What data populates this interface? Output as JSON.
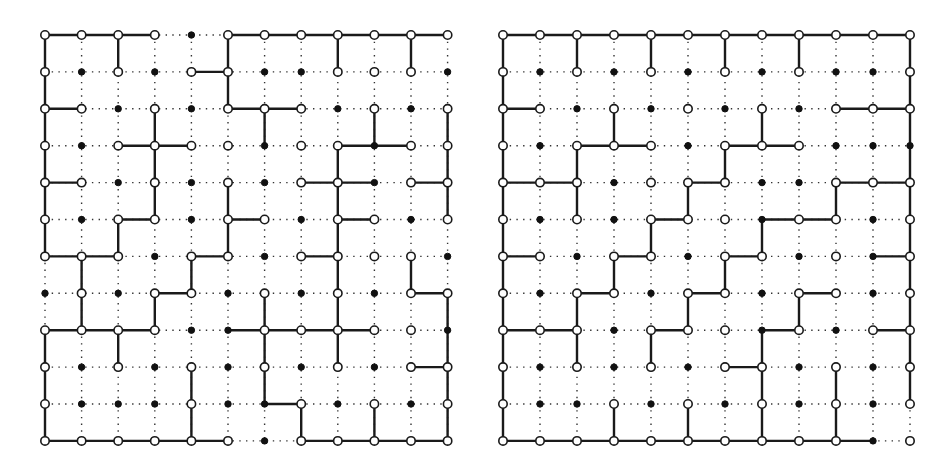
{
  "diagrams": [
    {
      "name": "left-grid",
      "origin": [
        45,
        35
      ],
      "spacing": [
        36.6,
        36.9
      ],
      "cols": 12,
      "rows": 12,
      "nodes": [
        "oooofooooooo",
        "ofofoofforof",
        "oofofooofofo",
        "ofoooofoofo o",
        "oofofofoofoo",
        "ofoofoofoofo",
        "ooofoofoooof",
        "fofoofofofoo",
        "ooooffooooofo",
        "ofofofofofoo",
        "offfoffofofo",
        "oooooofooooo"
      ],
      "h_edges": [
        [
          0,
          0
        ],
        [
          1,
          0
        ],
        [
          2,
          0
        ],
        [
          5,
          0
        ],
        [
          6,
          0
        ],
        [
          7,
          0
        ],
        [
          8,
          0
        ],
        [
          9,
          0
        ],
        [
          10,
          0
        ],
        [
          4,
          1
        ],
        [
          0,
          2
        ],
        [
          5,
          2
        ],
        [
          6,
          2
        ],
        [
          2,
          3
        ],
        [
          3,
          3
        ],
        [
          8,
          3
        ],
        [
          9,
          3
        ],
        [
          0,
          4
        ],
        [
          7,
          4
        ],
        [
          8,
          4
        ],
        [
          10,
          4
        ],
        [
          2,
          5
        ],
        [
          5,
          5
        ],
        [
          8,
          5
        ],
        [
          0,
          6
        ],
        [
          1,
          6
        ],
        [
          4,
          6
        ],
        [
          7,
          6
        ],
        [
          3,
          7
        ],
        [
          10,
          7
        ],
        [
          0,
          8
        ],
        [
          1,
          8
        ],
        [
          2,
          8
        ],
        [
          5,
          8
        ],
        [
          6,
          8
        ],
        [
          7,
          8
        ],
        [
          8,
          8
        ],
        [
          10,
          9
        ],
        [
          6,
          10
        ],
        [
          0,
          11
        ],
        [
          1,
          11
        ],
        [
          2,
          11
        ],
        [
          3,
          11
        ],
        [
          4,
          11
        ],
        [
          7,
          11
        ],
        [
          8,
          11
        ],
        [
          9,
          11
        ],
        [
          10,
          11
        ]
      ],
      "v_edges": [
        [
          0,
          0
        ],
        [
          2,
          0
        ],
        [
          5,
          0
        ],
        [
          8,
          0
        ],
        [
          10,
          0
        ],
        [
          0,
          1
        ],
        [
          5,
          1
        ],
        [
          0,
          2
        ],
        [
          3,
          2
        ],
        [
          6,
          2
        ],
        [
          9,
          2
        ],
        [
          11,
          2
        ],
        [
          0,
          3
        ],
        [
          3,
          3
        ],
        [
          8,
          3
        ],
        [
          11,
          3
        ],
        [
          0,
          4
        ],
        [
          3,
          4
        ],
        [
          5,
          4
        ],
        [
          8,
          4
        ],
        [
          11,
          4
        ],
        [
          0,
          5
        ],
        [
          2,
          5
        ],
        [
          5,
          5
        ],
        [
          8,
          5
        ],
        [
          1,
          6
        ],
        [
          4,
          6
        ],
        [
          8,
          6
        ],
        [
          10,
          6
        ],
        [
          1,
          7
        ],
        [
          3,
          7
        ],
        [
          6,
          7
        ],
        [
          8,
          7
        ],
        [
          11,
          7
        ],
        [
          0,
          8
        ],
        [
          2,
          8
        ],
        [
          6,
          8
        ],
        [
          8,
          8
        ],
        [
          11,
          8
        ],
        [
          0,
          9
        ],
        [
          4,
          9
        ],
        [
          6,
          9
        ],
        [
          11,
          9
        ],
        [
          0,
          10
        ],
        [
          4,
          10
        ],
        [
          7,
          10
        ],
        [
          9,
          10
        ],
        [
          11,
          10
        ]
      ]
    },
    {
      "name": "right-grid",
      "origin": [
        503,
        35
      ],
      "spacing": [
        37.0,
        36.9
      ],
      "cols": 12,
      "rows": 12,
      "nodes": [
        "oooooooooooo",
        "ofofofofoffo",
        "oofofofofooo",
        "ofooofooofffo",
        "ooofoooffooo",
        "ofofooofoofo",
        "oofoofoofofo",
        "ofoofoofoofo",
        "ooofooofofoo",
        "ofofofoofofo",
        "offofofofofo",
        "oooooooooof"
      ],
      "h_edges": [
        [
          0,
          0
        ],
        [
          1,
          0
        ],
        [
          2,
          0
        ],
        [
          3,
          0
        ],
        [
          4,
          0
        ],
        [
          5,
          0
        ],
        [
          6,
          0
        ],
        [
          7,
          0
        ],
        [
          8,
          0
        ],
        [
          9,
          0
        ],
        [
          10,
          0
        ],
        [
          0,
          2
        ],
        [
          9,
          2
        ],
        [
          10,
          2
        ],
        [
          2,
          3
        ],
        [
          3,
          3
        ],
        [
          6,
          3
        ],
        [
          7,
          3
        ],
        [
          0,
          4
        ],
        [
          1,
          4
        ],
        [
          5,
          4
        ],
        [
          9,
          4
        ],
        [
          10,
          4
        ],
        [
          4,
          5
        ],
        [
          7,
          5
        ],
        [
          8,
          5
        ],
        [
          0,
          6
        ],
        [
          3,
          6
        ],
        [
          6,
          6
        ],
        [
          10,
          6
        ],
        [
          2,
          7
        ],
        [
          5,
          7
        ],
        [
          8,
          7
        ],
        [
          0,
          8
        ],
        [
          1,
          8
        ],
        [
          4,
          8
        ],
        [
          7,
          8
        ],
        [
          10,
          8
        ],
        [
          6,
          9
        ],
        [
          0,
          11
        ],
        [
          1,
          11
        ],
        [
          2,
          11
        ],
        [
          3,
          11
        ],
        [
          4,
          11
        ],
        [
          5,
          11
        ],
        [
          6,
          11
        ],
        [
          7,
          11
        ],
        [
          8,
          11
        ],
        [
          9,
          11
        ]
      ],
      "v_edges": [
        [
          0,
          0
        ],
        [
          2,
          0
        ],
        [
          4,
          0
        ],
        [
          6,
          0
        ],
        [
          8,
          0
        ],
        [
          11,
          0
        ],
        [
          0,
          1
        ],
        [
          11,
          1
        ],
        [
          0,
          2
        ],
        [
          3,
          2
        ],
        [
          7,
          2
        ],
        [
          11,
          2
        ],
        [
          0,
          3
        ],
        [
          2,
          3
        ],
        [
          6,
          3
        ],
        [
          11,
          3
        ],
        [
          0,
          4
        ],
        [
          2,
          4
        ],
        [
          5,
          4
        ],
        [
          9,
          4
        ],
        [
          11,
          4
        ],
        [
          0,
          5
        ],
        [
          4,
          5
        ],
        [
          7,
          5
        ],
        [
          11,
          5
        ],
        [
          0,
          6
        ],
        [
          3,
          6
        ],
        [
          6,
          6
        ],
        [
          11,
          6
        ],
        [
          0,
          7
        ],
        [
          2,
          7
        ],
        [
          5,
          7
        ],
        [
          8,
          7
        ],
        [
          11,
          7
        ],
        [
          0,
          8
        ],
        [
          2,
          8
        ],
        [
          4,
          8
        ],
        [
          7,
          8
        ],
        [
          11,
          8
        ],
        [
          0,
          9
        ],
        [
          7,
          9
        ],
        [
          9,
          9
        ],
        [
          11,
          9
        ],
        [
          0,
          10
        ],
        [
          3,
          10
        ],
        [
          5,
          10
        ],
        [
          7,
          10
        ],
        [
          9,
          10
        ]
      ]
    }
  ],
  "legend": {
    "open_node": "open-circle",
    "filled_node": "filled-dot",
    "solid_edge": "solid-line",
    "dotted_edge": "dotted-line"
  },
  "colors": {
    "ink": "#1a1a1a",
    "background": "#ffffff"
  }
}
